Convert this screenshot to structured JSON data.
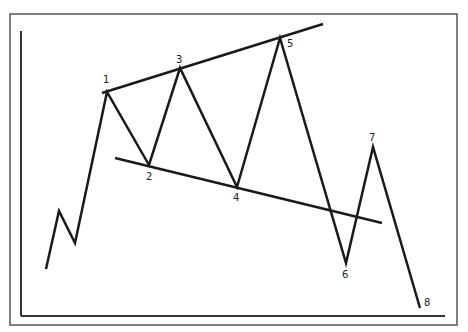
{
  "diagram": {
    "colors": {
      "background": "#ffffff",
      "line": "#1a1a1a",
      "frame": "#555555",
      "label": "#222222"
    },
    "frame": {
      "x": 10,
      "y": 14,
      "width": 447,
      "height": 311
    },
    "axes": {
      "y_axis": {
        "x": 21,
        "y1": 31,
        "y2": 316
      },
      "x_axis": {
        "y": 316,
        "x1": 21,
        "x2": 445
      }
    },
    "price_path": [
      {
        "x": 46,
        "y": 269
      },
      {
        "x": 59,
        "y": 211
      },
      {
        "x": 75,
        "y": 243
      },
      {
        "x": 107,
        "y": 92
      },
      {
        "x": 149,
        "y": 165
      },
      {
        "x": 180,
        "y": 68
      },
      {
        "x": 237,
        "y": 187
      },
      {
        "x": 280,
        "y": 38
      },
      {
        "x": 346,
        "y": 263
      },
      {
        "x": 373,
        "y": 147
      },
      {
        "x": 420,
        "y": 308
      }
    ],
    "trendlines": [
      {
        "name": "upper-resistance",
        "x1": 102,
        "y1": 93,
        "x2": 323,
        "y2": 24
      },
      {
        "name": "lower-support",
        "x1": 115,
        "y1": 158,
        "x2": 382,
        "y2": 223
      }
    ],
    "points": [
      {
        "label": "1",
        "x": 103,
        "y": 83
      },
      {
        "label": "2",
        "x": 146,
        "y": 180
      },
      {
        "label": "3",
        "x": 176,
        "y": 63
      },
      {
        "label": "4",
        "x": 233,
        "y": 201
      },
      {
        "label": "5",
        "x": 287,
        "y": 47
      },
      {
        "label": "6",
        "x": 342,
        "y": 278
      },
      {
        "label": "7",
        "x": 369,
        "y": 141
      },
      {
        "label": "8",
        "x": 424,
        "y": 306
      }
    ]
  }
}
